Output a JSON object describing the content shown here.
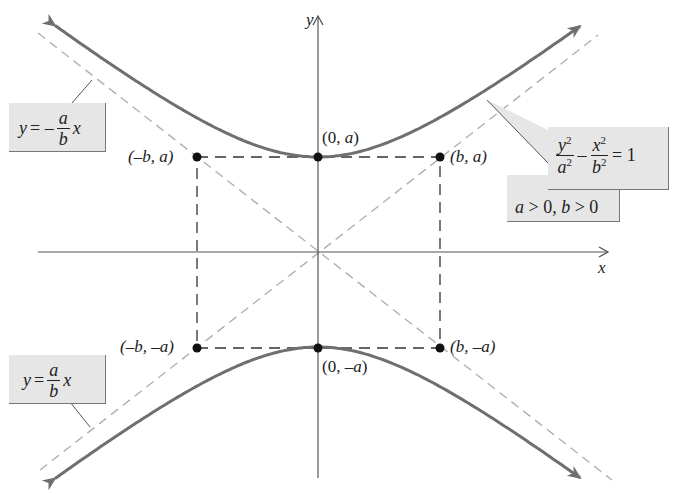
{
  "figure": {
    "colors": {
      "curve": "#6f6f6f",
      "asymptote": "#b0b0b0",
      "axis": "#555555",
      "box": "#333333",
      "point": "#111111",
      "callout_bg": "#e6e6e6"
    },
    "axes": {
      "x_label": "x",
      "y_label": "y"
    },
    "points": [
      {
        "id": "top-vertex",
        "label_pre": "(0, ",
        "label_var": "a",
        "label_post": ")"
      },
      {
        "id": "bottom-vertex",
        "label_pre": "(0, –",
        "label_var": "a",
        "label_post": ")"
      },
      {
        "id": "top-left",
        "label": "(–b, a)"
      },
      {
        "id": "top-right",
        "label": "(b, a)"
      },
      {
        "id": "bottom-left",
        "label": "(–b, –a)"
      },
      {
        "id": "bottom-right",
        "label": "(b, –a)"
      }
    ],
    "callouts": {
      "neg_asymptote": {
        "lhs": "y",
        "eq": "= –",
        "num": "a",
        "den": "b",
        "rhs": "x"
      },
      "pos_asymptote": {
        "lhs": "y",
        "eq": "=",
        "num": "a",
        "den": "b",
        "rhs": "x"
      },
      "equation": {
        "num1": "y",
        "den1": "a",
        "minus": "–",
        "num2": "x",
        "den2": "b",
        "exp": "2",
        "rhs": "= 1"
      },
      "condition": {
        "text_a": "a",
        "gt1": " > 0, ",
        "text_b": "b",
        "gt2": " > 0"
      }
    }
  }
}
